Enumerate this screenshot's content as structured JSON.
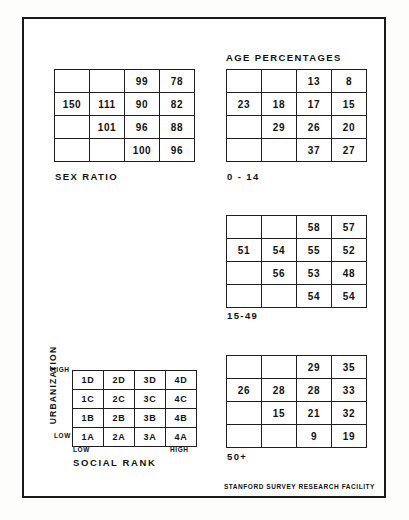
{
  "document": {
    "footer_credit": "STANFORD SURVEY RESEARCH FACILITY",
    "age_section_title": "AGE PERCENTAGES"
  },
  "legend": {
    "vertical_axis_label": "URBANIZATION",
    "vertical_axis_high": "HIGH",
    "vertical_axis_low": "LOW",
    "horizontal_axis_label": "SOCIAL RANK",
    "horizontal_axis_low": "LOW",
    "horizontal_axis_high": "HIGH",
    "cells": [
      [
        "1D",
        "2D",
        "3D",
        "4D"
      ],
      [
        "1C",
        "2C",
        "3C",
        "4C"
      ],
      [
        "1B",
        "2B",
        "3B",
        "4B"
      ],
      [
        "1A",
        "2A",
        "3A",
        "4A"
      ]
    ]
  },
  "chart_data": [
    {
      "type": "heatmap",
      "title": "SEX RATIO",
      "xlabel": "SOCIAL RANK",
      "ylabel": "URBANIZATION",
      "columns": [
        "1",
        "2",
        "3",
        "4"
      ],
      "rows": [
        "D",
        "C",
        "B",
        "A"
      ],
      "values": [
        [
          "",
          "",
          "99",
          "78"
        ],
        [
          "150",
          "111",
          "90",
          "82"
        ],
        [
          "",
          "101",
          "96",
          "88"
        ],
        [
          "",
          "",
          "100",
          "96"
        ]
      ],
      "grid": true,
      "legend": "none"
    },
    {
      "type": "heatmap",
      "title": "0 - 14",
      "group_title": "AGE PERCENTAGES",
      "xlabel": "SOCIAL RANK",
      "ylabel": "URBANIZATION",
      "columns": [
        "1",
        "2",
        "3",
        "4"
      ],
      "rows": [
        "D",
        "C",
        "B",
        "A"
      ],
      "values": [
        [
          "",
          "",
          "13",
          "8"
        ],
        [
          "23",
          "18",
          "17",
          "15"
        ],
        [
          "",
          "29",
          "26",
          "20"
        ],
        [
          "",
          "",
          "37",
          "27"
        ]
      ],
      "grid": true,
      "legend": "none"
    },
    {
      "type": "heatmap",
      "title": "15-49",
      "group_title": "AGE PERCENTAGES",
      "xlabel": "SOCIAL RANK",
      "ylabel": "URBANIZATION",
      "columns": [
        "1",
        "2",
        "3",
        "4"
      ],
      "rows": [
        "D",
        "C",
        "B",
        "A"
      ],
      "values": [
        [
          "",
          "",
          "58",
          "57"
        ],
        [
          "51",
          "54",
          "55",
          "52"
        ],
        [
          "",
          "56",
          "53",
          "48"
        ],
        [
          "",
          "",
          "54",
          "54"
        ]
      ],
      "grid": true,
      "legend": "none"
    },
    {
      "type": "heatmap",
      "title": "50+",
      "group_title": "AGE PERCENTAGES",
      "xlabel": "SOCIAL RANK",
      "ylabel": "URBANIZATION",
      "columns": [
        "1",
        "2",
        "3",
        "4"
      ],
      "rows": [
        "D",
        "C",
        "B",
        "A"
      ],
      "values": [
        [
          "",
          "",
          "29",
          "35"
        ],
        [
          "26",
          "28",
          "28",
          "33"
        ],
        [
          "",
          "15",
          "21",
          "32"
        ],
        [
          "",
          "",
          "9",
          "19"
        ]
      ],
      "grid": true,
      "legend": "none"
    }
  ]
}
